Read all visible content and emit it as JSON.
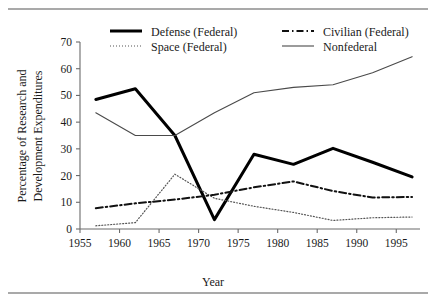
{
  "chart_data": {
    "type": "line",
    "title": "",
    "xlabel": "Year",
    "ylabel": "Percentage of Research and Development Expenditures",
    "ylabel_line1": "Percentage of Research and",
    "ylabel_line2": "Development Expenditures",
    "xlim": [
      1955,
      1998
    ],
    "ylim": [
      0,
      70
    ],
    "xticks": [
      1955,
      1960,
      1965,
      1970,
      1975,
      1980,
      1985,
      1990,
      1995
    ],
    "yticks": [
      0,
      10,
      20,
      30,
      40,
      50,
      60,
      70
    ],
    "grid": false,
    "legend_position": "top-inside",
    "series": [
      {
        "name": "Defense (Federal)",
        "style": "solid-thick",
        "color": "#000000",
        "width": 3.0,
        "dash": "",
        "x": [
          1957,
          1962,
          1967,
          1972,
          1977,
          1982,
          1987,
          1992,
          1997
        ],
        "values": [
          48.5,
          52.5,
          35.0,
          3.5,
          28.0,
          24.2,
          30.2,
          25.0,
          19.5
        ]
      },
      {
        "name": "Space (Federal)",
        "style": "dotted",
        "color": "#555555",
        "width": 1.2,
        "dash": "1,2",
        "x": [
          1957,
          1962,
          1967,
          1972,
          1977,
          1982,
          1987,
          1992,
          1997
        ],
        "values": [
          1.2,
          2.4,
          20.5,
          11.5,
          8.5,
          6.2,
          3.2,
          4.2,
          4.5
        ]
      },
      {
        "name": "Civilian (Federal)",
        "style": "dash-dot",
        "color": "#111111",
        "width": 2.0,
        "dash": "7,3,1.5,3",
        "x": [
          1957,
          1962,
          1967,
          1972,
          1977,
          1982,
          1987,
          1992,
          1997
        ],
        "values": [
          7.8,
          9.6,
          11.0,
          12.8,
          15.6,
          17.8,
          14.2,
          11.8,
          12.0
        ]
      },
      {
        "name": "Nonfederal",
        "style": "solid-thin",
        "color": "#4a4a4a",
        "width": 1.1,
        "dash": "",
        "x": [
          1957,
          1962,
          1967,
          1972,
          1977,
          1982,
          1987,
          1992,
          1997
        ],
        "values": [
          43.5,
          35.0,
          35.0,
          43.5,
          51.0,
          53.0,
          54.0,
          58.5,
          64.5
        ]
      }
    ],
    "legend_entries": [
      {
        "label": "Defense (Federal)",
        "series_index": 0,
        "column": 0,
        "row": 0
      },
      {
        "label": "Space (Federal)",
        "series_index": 1,
        "column": 0,
        "row": 1
      },
      {
        "label": "Civilian (Federal)",
        "series_index": 2,
        "column": 1,
        "row": 0
      },
      {
        "label": "Nonfederal",
        "series_index": 3,
        "column": 1,
        "row": 1
      }
    ]
  },
  "figure": {
    "top_rule": true,
    "bottom_rule": true,
    "background": "#ffffff"
  }
}
